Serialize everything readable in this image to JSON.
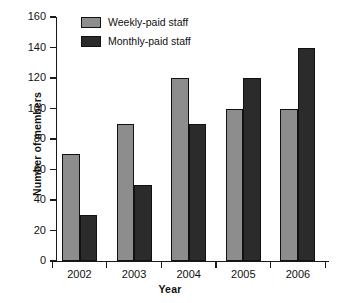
{
  "chart_data": {
    "type": "bar",
    "title": "",
    "xlabel": "Year",
    "ylabel": "Number of members",
    "categories": [
      "2002",
      "2003",
      "2004",
      "2005",
      "2006"
    ],
    "series": [
      {
        "name": "Weekly-paid staff",
        "values": [
          70,
          90,
          120,
          100,
          100
        ],
        "color": "#8d8d8d"
      },
      {
        "name": "Monthly-paid staff",
        "values": [
          30,
          50,
          90,
          120,
          140
        ],
        "color": "#2b2b2b"
      }
    ],
    "ylim": [
      0,
      160
    ],
    "ytick_labels": [
      "0",
      "20",
      "40",
      "60",
      "80",
      "100",
      "120",
      "140",
      "160"
    ],
    "ytick_values": [
      0,
      20,
      40,
      60,
      80,
      100,
      120,
      140,
      160
    ],
    "ystep": 20,
    "grid": false,
    "legend_position": "top-left-inside"
  },
  "legend": {
    "items": [
      {
        "label": "Weekly-paid staff",
        "swatch": "weekly"
      },
      {
        "label": "Monthly-paid staff",
        "swatch": "monthly"
      }
    ]
  }
}
